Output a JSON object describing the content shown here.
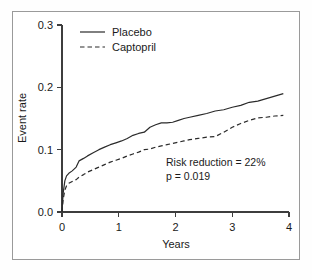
{
  "chart_data": {
    "type": "line",
    "title": "",
    "xlabel": "Years",
    "ylabel": "Event rate",
    "xlim": [
      0,
      4
    ],
    "ylim": [
      0.0,
      0.3
    ],
    "xticks": [
      "0",
      "1",
      "2",
      "3",
      "4"
    ],
    "yticks": [
      "0.0",
      "0.1",
      "0.2",
      "0.3"
    ],
    "xtick_values": [
      0,
      1,
      2,
      3,
      4
    ],
    "ytick_values": [
      0.0,
      0.1,
      0.2,
      0.3
    ],
    "grid": false,
    "legend_position": "top-left",
    "legend": [
      "Placebo",
      "Captopril"
    ],
    "annotations": [
      "Risk reduction = 22%",
      "p = 0.019"
    ],
    "series": [
      {
        "name": "Placebo",
        "style": "solid",
        "color": "#2b2b2b",
        "x": [
          0.0,
          0.02,
          0.05,
          0.08,
          0.12,
          0.18,
          0.25,
          0.3,
          0.38,
          0.45,
          0.55,
          0.65,
          0.75,
          0.85,
          0.95,
          1.05,
          1.15,
          1.25,
          1.35,
          1.45,
          1.55,
          1.65,
          1.75,
          1.85,
          1.95,
          2.05,
          2.15,
          2.25,
          2.4,
          2.55,
          2.7,
          2.85,
          3.0,
          3.15,
          3.3,
          3.45,
          3.6,
          3.75,
          3.9
        ],
        "y": [
          0.0,
          0.03,
          0.05,
          0.058,
          0.062,
          0.066,
          0.072,
          0.082,
          0.086,
          0.09,
          0.095,
          0.1,
          0.104,
          0.108,
          0.111,
          0.114,
          0.118,
          0.123,
          0.126,
          0.128,
          0.136,
          0.14,
          0.143,
          0.143,
          0.144,
          0.147,
          0.15,
          0.152,
          0.155,
          0.158,
          0.162,
          0.164,
          0.168,
          0.171,
          0.176,
          0.178,
          0.182,
          0.186,
          0.19
        ]
      },
      {
        "name": "Captopril",
        "style": "dashed",
        "color": "#2b2b2b",
        "x": [
          0.0,
          0.02,
          0.05,
          0.08,
          0.12,
          0.18,
          0.25,
          0.3,
          0.38,
          0.45,
          0.55,
          0.65,
          0.75,
          0.85,
          0.95,
          1.05,
          1.15,
          1.25,
          1.35,
          1.45,
          1.55,
          1.65,
          1.75,
          1.85,
          1.95,
          2.05,
          2.15,
          2.25,
          2.4,
          2.55,
          2.7,
          2.85,
          3.0,
          3.15,
          3.3,
          3.45,
          3.6,
          3.75,
          3.9
        ],
        "y": [
          0.0,
          0.02,
          0.035,
          0.042,
          0.046,
          0.049,
          0.052,
          0.056,
          0.06,
          0.064,
          0.068,
          0.072,
          0.076,
          0.08,
          0.083,
          0.086,
          0.09,
          0.093,
          0.096,
          0.1,
          0.101,
          0.104,
          0.106,
          0.108,
          0.11,
          0.112,
          0.114,
          0.116,
          0.118,
          0.12,
          0.121,
          0.128,
          0.136,
          0.142,
          0.147,
          0.151,
          0.152,
          0.154,
          0.155
        ]
      }
    ]
  }
}
